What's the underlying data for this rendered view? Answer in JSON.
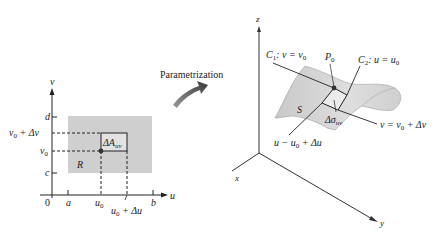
{
  "left_panel": {
    "axis_u": "u",
    "axis_v": "v",
    "origin": "0",
    "tick_a": "a",
    "tick_b": "b",
    "tick_c": "c",
    "tick_d": "d",
    "u0": "u",
    "u0_sub": "0",
    "u0_plus_du": "u",
    "u0_plus_du_sub": "0",
    "u0_plus_du_rest": " + Δu",
    "v0": "v",
    "v0_sub": "0",
    "v0_plus_dv": "v",
    "v0_plus_dv_sub": "0",
    "v0_plus_dv_rest": " + Δv",
    "region_label": "R",
    "area_label": "ΔA",
    "area_sub": "uv",
    "region_color": "#cfcfcf"
  },
  "arrow": {
    "label": "Parametrization",
    "color": "#555555"
  },
  "right_panel": {
    "axis_x": "x",
    "axis_y": "y",
    "axis_z": "z",
    "surface_label": "S",
    "point_label": "P",
    "point_sub": "0",
    "c1_label": "C",
    "c1_sub": "1",
    "c1_rest": ": v = v",
    "c1_rest_sub": "0",
    "c2_label": "C",
    "c2_sub": "2",
    "c2_rest": ": u = u",
    "c2_rest_sub": "0",
    "dsigma_label": "Δσ",
    "dsigma_sub": "uv",
    "v_line_label": "v = v",
    "v_line_sub": "0",
    "v_line_rest": " + Δv",
    "u_line_label": "u − u",
    "u_line_sub": "0",
    "u_line_rest": " + Δu",
    "surface_color": "#d6d6d6"
  }
}
